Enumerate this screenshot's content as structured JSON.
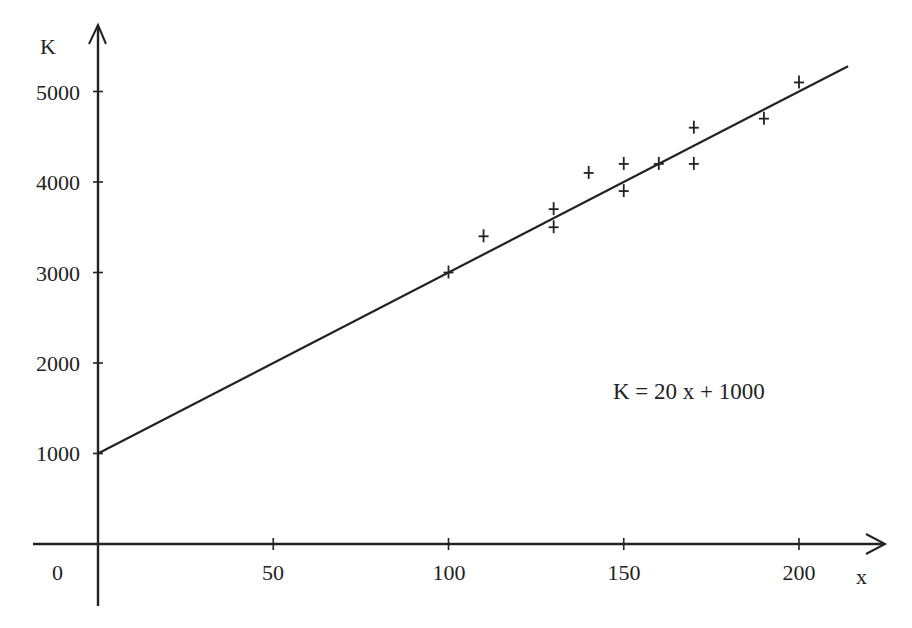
{
  "chart_data": {
    "type": "scatter",
    "title": "",
    "xlabel": "x",
    "ylabel": "K",
    "origin_label": "0",
    "xlim": [
      0,
      222
    ],
    "ylim": [
      0,
      5600
    ],
    "grid": false,
    "x_ticks": [
      50,
      100,
      150,
      200
    ],
    "x_tick_labels": [
      "50",
      "100",
      "150",
      "200"
    ],
    "y_ticks": [
      1000,
      2000,
      3000,
      4000,
      5000
    ],
    "y_tick_labels": [
      "1000",
      "2000",
      "3000",
      "4000",
      "5000"
    ],
    "series": [
      {
        "name": "observations",
        "marker": "+",
        "points": [
          {
            "x": 100,
            "y": 3000
          },
          {
            "x": 110,
            "y": 3400
          },
          {
            "x": 130,
            "y": 3700
          },
          {
            "x": 130,
            "y": 3500
          },
          {
            "x": 140,
            "y": 4100
          },
          {
            "x": 150,
            "y": 4200
          },
          {
            "x": 150,
            "y": 3900
          },
          {
            "x": 160,
            "y": 4200
          },
          {
            "x": 170,
            "y": 4600
          },
          {
            "x": 170,
            "y": 4200
          },
          {
            "x": 190,
            "y": 4700
          },
          {
            "x": 200,
            "y": 5100
          }
        ]
      },
      {
        "name": "fit",
        "type": "line",
        "slope": 20,
        "intercept": 1000,
        "x_range": [
          0,
          214
        ]
      }
    ],
    "annotations": [
      {
        "text": "K = 20 x + 1000",
        "x": 165,
        "y": 1550
      }
    ]
  },
  "labels": {
    "y_axis": "K",
    "x_axis": "x",
    "origin": "0",
    "equation": "K = 20 x + 1000",
    "y_ticks": [
      "5000",
      "4000",
      "3000",
      "2000",
      "1000"
    ],
    "x_ticks": [
      "50",
      "100",
      "150",
      "200"
    ]
  },
  "colors": {
    "ink": "#222222",
    "background": "#ffffff"
  }
}
